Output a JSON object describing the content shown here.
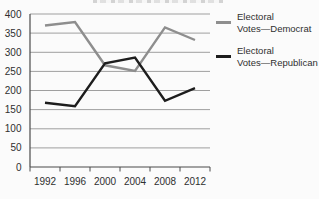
{
  "figure": {
    "background": "#fbfbfb"
  },
  "chart_data": {
    "type": "line",
    "title": "",
    "xlabel": "",
    "ylabel": "",
    "categories": [
      "1992",
      "1996",
      "2000",
      "2004",
      "2008",
      "2012"
    ],
    "series": [
      {
        "name": "Electoral Votes—Democrat",
        "color": "#8e8e8e",
        "values": [
          370,
          379,
          266,
          251,
          365,
          332
        ]
      },
      {
        "name": "Electoral Votes—Republican",
        "color": "#1d1d1d",
        "values": [
          168,
          159,
          271,
          286,
          173,
          206
        ]
      }
    ],
    "ylim": [
      0,
      400
    ],
    "yticks": [
      0,
      50,
      100,
      150,
      200,
      250,
      300,
      350,
      400
    ],
    "grid": true,
    "legend_position": "right"
  },
  "legend": {
    "items": [
      {
        "line1": "Electoral",
        "line2": "Votes—Democrat"
      },
      {
        "line1": "Electoral",
        "line2": "Votes—Republican"
      }
    ]
  },
  "colors": {
    "democrat_line": "#8e8e8e",
    "republican_line": "#1d1d1d",
    "gridline": "#9f9f9f",
    "axis": "#4a4a4a",
    "tick_text": "#2f2f2f"
  }
}
